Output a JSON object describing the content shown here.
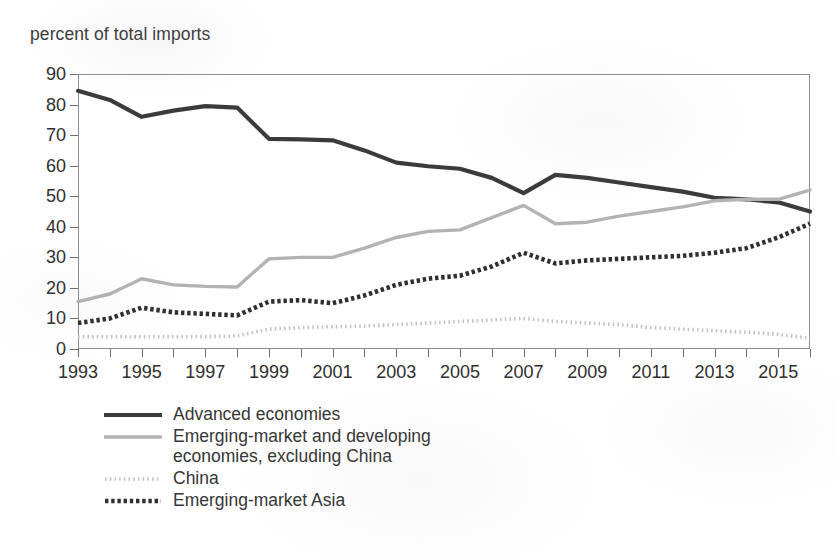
{
  "caption": "percent of total imports",
  "legend": [
    {
      "key": "advanced",
      "label": "Advanced economies",
      "style": "solid-dark",
      "color": "#3b3b3b"
    },
    {
      "key": "em_ex_china",
      "label": "Emerging-market and developing\neconomies, excluding China",
      "style": "solid-gray",
      "color": "#b3b3b3"
    },
    {
      "key": "china",
      "label": "China",
      "style": "dotted-light",
      "color": "#c4c4c4"
    },
    {
      "key": "em_asia",
      "label": "Emerging-market Asia",
      "style": "dotted-dark",
      "color": "#2f2f2f"
    }
  ],
  "axis": {
    "y_ticks": [
      0,
      10,
      20,
      30,
      40,
      50,
      60,
      70,
      80,
      90
    ],
    "x_labels": [
      "1993",
      "1995",
      "1997",
      "1999",
      "2001",
      "2003",
      "2005",
      "2007",
      "2009",
      "2011",
      "2013",
      "2015"
    ]
  },
  "chart_data": {
    "type": "line",
    "title": "",
    "subtitle": "",
    "xlabel": "",
    "ylabel": "percent of total imports",
    "xlim": [
      1993,
      2016
    ],
    "ylim": [
      0,
      90
    ],
    "grid": false,
    "legend_position": "below",
    "x": [
      1993,
      1994,
      1995,
      1996,
      1997,
      1998,
      1999,
      2000,
      2001,
      2002,
      2003,
      2004,
      2005,
      2006,
      2007,
      2008,
      2009,
      2010,
      2011,
      2012,
      2013,
      2014,
      2015,
      2016
    ],
    "series": [
      {
        "name": "Advanced economies",
        "color": "#3b3b3b",
        "style": "solid-dark",
        "values": [
          84.5,
          81.5,
          76.0,
          78.0,
          79.5,
          79.0,
          68.8,
          68.6,
          68.3,
          65.0,
          61.0,
          59.8,
          59.0,
          56.0,
          51.0,
          57.0,
          56.0,
          54.5,
          53.0,
          51.5,
          49.5,
          49.0,
          48.0,
          45.0
        ]
      },
      {
        "name": "Emerging-market and developing economies, excluding China",
        "color": "#b3b3b3",
        "style": "solid-gray",
        "values": [
          15.5,
          18.0,
          23.0,
          21.0,
          20.5,
          20.3,
          29.5,
          30.0,
          30.0,
          33.0,
          36.5,
          38.5,
          39.0,
          43.0,
          47.0,
          41.0,
          41.5,
          43.5,
          45.0,
          46.5,
          48.5,
          49.0,
          49.0,
          52.0
        ]
      },
      {
        "name": "China",
        "color": "#c4c4c4",
        "style": "dotted-light",
        "values": [
          4.0,
          4.0,
          4.0,
          4.0,
          4.0,
          4.3,
          6.5,
          7.0,
          7.3,
          7.5,
          8.0,
          8.5,
          9.0,
          9.5,
          10.0,
          9.0,
          8.5,
          8.0,
          7.0,
          6.5,
          6.0,
          5.5,
          4.8,
          3.5
        ]
      },
      {
        "name": "Emerging-market Asia",
        "color": "#2f2f2f",
        "style": "dotted-dark",
        "values": [
          8.5,
          10.0,
          13.5,
          12.0,
          11.5,
          11.0,
          15.5,
          16.0,
          15.0,
          17.5,
          21.0,
          23.0,
          24.0,
          27.0,
          31.5,
          28.0,
          29.0,
          29.5,
          30.0,
          30.5,
          31.5,
          33.0,
          36.5,
          41.0
        ]
      }
    ]
  }
}
